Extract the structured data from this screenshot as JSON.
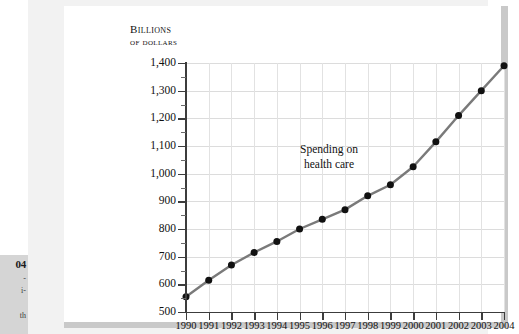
{
  "figure": {
    "axis_title_line1": "Billions",
    "axis_title_line2": "of dollars",
    "annotation_line1": "Spending on",
    "annotation_line2": "health care",
    "line_color": "#7a7a7a",
    "marker_color": "#111111",
    "grid_color": "#dcdcdc",
    "axis_color": "#3c3c3c"
  },
  "sidebar": {
    "caption_number": "04",
    "caption_fragment_1": "-",
    "caption_fragment_2": "i-",
    "caption_fragment_3": "th"
  },
  "chart_data": {
    "type": "line",
    "title": "",
    "subtitle": "",
    "xlabel": "",
    "ylabel": "Billions of dollars",
    "annotations": [
      "Spending on health care"
    ],
    "legend": [],
    "legend_position": "none",
    "grid": true,
    "xlim": [
      1990,
      2004
    ],
    "ylim": [
      500,
      1400
    ],
    "ytick_step": 100,
    "categories": [
      "1990",
      "1991",
      "1992",
      "1993",
      "1994",
      "1995",
      "1996",
      "1997",
      "1998",
      "1999",
      "2000",
      "2001",
      "2002",
      "2003",
      "2004"
    ],
    "ytick_labels": [
      "1,400",
      "1,300",
      "1,200",
      "1,100",
      "1,000",
      "900",
      "800",
      "700",
      "600",
      "500"
    ],
    "ytick_values": [
      1400,
      1300,
      1200,
      1100,
      1000,
      900,
      800,
      700,
      600,
      500
    ],
    "series": [
      {
        "name": "Spending on health care",
        "x": [
          1990,
          1991,
          1992,
          1993,
          1994,
          1995,
          1996,
          1997,
          1998,
          1999,
          2000,
          2001,
          2002,
          2003,
          2004
        ],
        "values": [
          555,
          615,
          670,
          715,
          755,
          800,
          835,
          870,
          920,
          960,
          1025,
          1115,
          1210,
          1300,
          1390
        ]
      }
    ]
  }
}
